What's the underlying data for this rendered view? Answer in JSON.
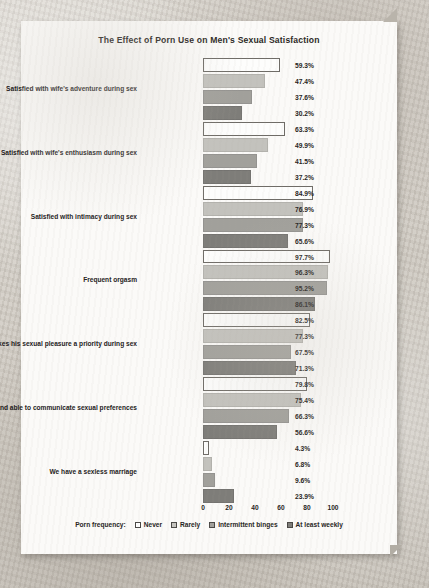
{
  "chart_data": {
    "type": "bar",
    "orientation": "horizontal",
    "title": "The Effect of Porn Use on Men's Sexual Satisfaction",
    "xlabel": "",
    "ylabel": "",
    "xlim": [
      0,
      100
    ],
    "xticks": [
      0,
      20,
      40,
      60,
      80,
      100
    ],
    "grid": false,
    "legend_position": "bottom",
    "legend_title": "Porn frequency:",
    "categories": [
      "Satisfied with wife's adventure during sex",
      "Satisfied with wife's enthusiasm during sex",
      "Satisfied with intimacy during sex",
      "Frequent orgasm",
      "Wife makes his sexual pleasure a priority during sex",
      "Husband able to communicate sexual preferences",
      "We have a sexless marriage"
    ],
    "series": [
      {
        "name": "Never",
        "swatch": "sw0",
        "color": "#ffffff",
        "values": [
          59.3,
          63.3,
          84.9,
          97.7,
          82.5,
          79.8,
          4.3
        ]
      },
      {
        "name": "Rarely",
        "swatch": "sw1",
        "color": "#c6c5c0",
        "values": [
          47.4,
          49.9,
          76.9,
          96.3,
          77.3,
          75.4,
          6.8
        ]
      },
      {
        "name": "Intermittent binges",
        "swatch": "sw2",
        "color": "#a2a19c",
        "values": [
          37.6,
          41.5,
          77.3,
          95.2,
          67.5,
          66.3,
          9.6
        ]
      },
      {
        "name": "At least weekly",
        "swatch": "sw3",
        "color": "#7d7c78",
        "values": [
          30.2,
          37.2,
          65.6,
          86.1,
          71.3,
          56.6,
          23.9
        ]
      }
    ],
    "value_labels": [
      [
        "59.3%",
        "47.4%",
        "37.6%",
        "30.2%"
      ],
      [
        "63.3%",
        "49.9%",
        "41.5%",
        "37.2%"
      ],
      [
        "84.9%",
        "76.9%",
        "77.3%",
        "65.6%"
      ],
      [
        "97.7%",
        "96.3%",
        "95.2%",
        "86.1%"
      ],
      [
        "82.5%",
        "77.3%",
        "67.5%",
        "71.3%"
      ],
      [
        "79.8%",
        "75.4%",
        "66.3%",
        "56.6%"
      ],
      [
        "4.3%",
        "6.8%",
        "9.6%",
        "23.9%"
      ]
    ],
    "xtick_labels": [
      "0",
      "20",
      "40",
      "60",
      "80",
      "100"
    ]
  }
}
